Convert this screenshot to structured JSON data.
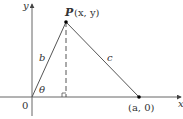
{
  "diagram": {
    "axes": {
      "x_label": "x",
      "y_label": "y",
      "origin_label": "0"
    },
    "points": {
      "P": {
        "name": "P",
        "coords": "(x, y)"
      },
      "A": {
        "label": "(a, 0)"
      }
    },
    "sides": {
      "b": "b",
      "c": "c"
    },
    "angle": "θ",
    "right_angle_marker": true,
    "colors": {
      "line": "#555555",
      "text": "#333333",
      "point": "#000000"
    }
  }
}
